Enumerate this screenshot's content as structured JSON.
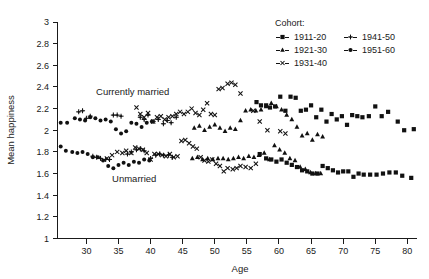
{
  "chart_data": {
    "type": "scatter",
    "title": "",
    "xlabel": "Age",
    "ylabel": "Mean happiness",
    "xlim": [
      25.5,
      81.5
    ],
    "ylim": [
      1,
      3
    ],
    "xticks": [
      30,
      35,
      40,
      45,
      50,
      55,
      60,
      65,
      70,
      75,
      80
    ],
    "yticks": [
      1,
      1.2,
      1.4,
      1.6,
      1.8,
      2,
      2.2,
      2.4,
      2.6,
      2.8,
      3
    ],
    "grid": false,
    "legend_position": "top-right",
    "legend_title": "Cohort:",
    "annotations": [
      {
        "text": "Currently married",
        "x": 31.5,
        "y": 2.33
      },
      {
        "text": "Unmarried",
        "x": 34.0,
        "y": 1.52
      }
    ],
    "groups": [
      {
        "name": "Currently married",
        "description": "upper band of points"
      },
      {
        "name": "Unmarried",
        "description": "lower band of points"
      }
    ],
    "series": [
      {
        "name": "1911-20",
        "marker": "square",
        "group": "Currently married",
        "points": [
          [
            56.5,
            2.26
          ],
          [
            57.2,
            2.23
          ],
          [
            58.0,
            2.23
          ],
          [
            58.6,
            2.21
          ],
          [
            59.4,
            2.22
          ],
          [
            60.2,
            2.31
          ],
          [
            61.0,
            2.18
          ],
          [
            61.8,
            2.31
          ],
          [
            62.6,
            2.3
          ],
          [
            63.4,
            2.18
          ],
          [
            64.2,
            2.19
          ],
          [
            65.0,
            2.23
          ],
          [
            65.8,
            2.12
          ],
          [
            66.6,
            2.19
          ],
          [
            67.4,
            2.08
          ],
          [
            68.2,
            2.15
          ],
          [
            69.0,
            2.1
          ],
          [
            69.8,
            2.13
          ],
          [
            70.6,
            2.05
          ],
          [
            71.4,
            2.14
          ],
          [
            72.2,
            2.13
          ],
          [
            73.0,
            2.12
          ],
          [
            74.0,
            2.13
          ],
          [
            75.0,
            2.22
          ],
          [
            76.0,
            2.13
          ],
          [
            77.0,
            2.17
          ],
          [
            78.5,
            2.08
          ],
          [
            79.5,
            2.0
          ],
          [
            81.0,
            2.01
          ]
        ]
      },
      {
        "name": "1911-20",
        "marker": "square",
        "group": "Unmarried",
        "points": [
          [
            57.0,
            1.78
          ],
          [
            58.0,
            1.74
          ],
          [
            58.8,
            1.73
          ],
          [
            59.6,
            1.71
          ],
          [
            60.4,
            1.73
          ],
          [
            61.2,
            1.7
          ],
          [
            62.0,
            1.68
          ],
          [
            62.8,
            1.66
          ],
          [
            63.6,
            1.63
          ],
          [
            64.4,
            1.62
          ],
          [
            65.2,
            1.6
          ],
          [
            66.0,
            1.6
          ],
          [
            66.8,
            1.67
          ],
          [
            67.6,
            1.65
          ],
          [
            68.4,
            1.63
          ],
          [
            69.2,
            1.61
          ],
          [
            70.0,
            1.62
          ],
          [
            70.8,
            1.62
          ],
          [
            71.6,
            1.57
          ],
          [
            72.4,
            1.6
          ],
          [
            73.2,
            1.59
          ],
          [
            74.2,
            1.59
          ],
          [
            75.2,
            1.59
          ],
          [
            76.2,
            1.6
          ],
          [
            77.2,
            1.61
          ],
          [
            78.2,
            1.61
          ],
          [
            79.2,
            1.58
          ],
          [
            80.6,
            1.56
          ]
        ]
      },
      {
        "name": "1921-30",
        "marker": "triangle",
        "group": "Currently married",
        "points": [
          [
            46.8,
            2.02
          ],
          [
            47.6,
            2.04
          ],
          [
            48.4,
            2.0
          ],
          [
            49.2,
            2.03
          ],
          [
            50.0,
            2.05
          ],
          [
            50.8,
            2.02
          ],
          [
            51.6,
            1.99
          ],
          [
            52.4,
            2.02
          ],
          [
            53.2,
            2.01
          ],
          [
            54.0,
            2.09
          ],
          [
            54.8,
            2.18
          ],
          [
            55.6,
            2.19
          ],
          [
            56.4,
            2.18
          ],
          [
            57.2,
            2.19
          ],
          [
            58.0,
            2.22
          ],
          [
            58.8,
            2.25
          ],
          [
            59.6,
            2.22
          ],
          [
            60.4,
            2.19
          ],
          [
            61.2,
            2.14
          ],
          [
            62.0,
            2.1
          ],
          [
            62.8,
            2.03
          ],
          [
            63.6,
            1.95
          ],
          [
            64.4,
            1.97
          ],
          [
            65.2,
            1.91
          ],
          [
            66.0,
            1.96
          ],
          [
            66.8,
            1.94
          ]
        ]
      },
      {
        "name": "1921-30",
        "marker": "triangle",
        "group": "Unmarried",
        "points": [
          [
            46.5,
            1.74
          ],
          [
            47.3,
            1.75
          ],
          [
            48.1,
            1.73
          ],
          [
            48.9,
            1.74
          ],
          [
            49.7,
            1.73
          ],
          [
            50.5,
            1.74
          ],
          [
            51.3,
            1.74
          ],
          [
            52.1,
            1.73
          ],
          [
            52.9,
            1.74
          ],
          [
            53.7,
            1.75
          ],
          [
            54.5,
            1.74
          ],
          [
            55.3,
            1.76
          ],
          [
            56.1,
            1.75
          ],
          [
            56.9,
            1.77
          ],
          [
            57.7,
            1.79
          ],
          [
            58.5,
            1.73
          ],
          [
            59.3,
            1.86
          ],
          [
            60.1,
            1.82
          ],
          [
            60.9,
            1.79
          ],
          [
            61.7,
            1.74
          ],
          [
            62.5,
            1.72
          ],
          [
            63.3,
            1.66
          ],
          [
            64.1,
            1.64
          ],
          [
            64.9,
            1.61
          ],
          [
            65.7,
            1.6
          ],
          [
            66.5,
            1.6
          ]
        ]
      },
      {
        "name": "1931-40",
        "marker": "x",
        "group": "Currently married",
        "points": [
          [
            37.8,
            2.21
          ],
          [
            38.4,
            2.15
          ],
          [
            39.0,
            2.12
          ],
          [
            39.6,
            2.16
          ],
          [
            40.4,
            2.08
          ],
          [
            41.0,
            2.12
          ],
          [
            41.6,
            2.13
          ],
          [
            42.2,
            2.1
          ],
          [
            42.8,
            2.12
          ],
          [
            43.4,
            2.13
          ],
          [
            44.0,
            2.15
          ],
          [
            44.6,
            2.17
          ],
          [
            45.2,
            2.15
          ],
          [
            45.8,
            2.17
          ],
          [
            46.4,
            2.2
          ],
          [
            47.0,
            2.16
          ],
          [
            47.6,
            2.14
          ],
          [
            48.2,
            2.19
          ],
          [
            48.8,
            2.25
          ],
          [
            49.4,
            2.15
          ],
          [
            50.0,
            2.14
          ],
          [
            50.6,
            2.38
          ],
          [
            51.2,
            2.39
          ],
          [
            52.0,
            2.43
          ],
          [
            52.6,
            2.44
          ],
          [
            53.2,
            2.42
          ],
          [
            54.0,
            2.34
          ],
          [
            56.0,
            2.18
          ],
          [
            57.0,
            2.08
          ],
          [
            58.2,
            2.0
          ],
          [
            60.2,
            1.99
          ],
          [
            61.0,
            1.97
          ]
        ]
      },
      {
        "name": "1931-40",
        "marker": "x",
        "group": "Unmarried",
        "points": [
          [
            33.2,
            1.74
          ],
          [
            34.0,
            1.77
          ],
          [
            34.8,
            1.8
          ],
          [
            35.6,
            1.79
          ],
          [
            36.2,
            1.81
          ],
          [
            37.0,
            1.79
          ],
          [
            37.6,
            1.84
          ],
          [
            38.2,
            1.83
          ],
          [
            38.8,
            1.82
          ],
          [
            39.4,
            1.79
          ],
          [
            40.0,
            1.73
          ],
          [
            40.6,
            1.78
          ],
          [
            41.2,
            1.78
          ],
          [
            41.8,
            1.77
          ],
          [
            42.4,
            1.76
          ],
          [
            43.0,
            1.78
          ],
          [
            43.6,
            1.75
          ],
          [
            44.2,
            1.76
          ],
          [
            44.8,
            1.9
          ],
          [
            45.4,
            1.91
          ],
          [
            46.0,
            1.88
          ],
          [
            46.6,
            1.85
          ],
          [
            47.2,
            1.83
          ],
          [
            47.8,
            1.75
          ],
          [
            48.4,
            1.72
          ],
          [
            49.0,
            1.71
          ],
          [
            49.6,
            1.73
          ],
          [
            50.2,
            1.69
          ],
          [
            50.8,
            1.67
          ],
          [
            51.4,
            1.62
          ],
          [
            52.0,
            1.65
          ],
          [
            52.8,
            1.64
          ],
          [
            53.4,
            1.65
          ],
          [
            54.0,
            1.67
          ],
          [
            54.8,
            1.66
          ],
          [
            55.6,
            1.65
          ],
          [
            56.4,
            1.69
          ]
        ]
      },
      {
        "name": "1941-50",
        "marker": "plus",
        "group": "Currently married",
        "points": [
          [
            28.8,
            2.17
          ],
          [
            29.4,
            2.18
          ],
          [
            30.0,
            2.11
          ],
          [
            30.6,
            2.13
          ],
          [
            34.2,
            2.14
          ],
          [
            34.8,
            2.14
          ],
          [
            35.4,
            2.13
          ],
          [
            38.4,
            2.12
          ],
          [
            39.0,
            2.1
          ],
          [
            39.6,
            2.14
          ],
          [
            40.4,
            2.08
          ],
          [
            41.2,
            2.1
          ],
          [
            42.0,
            2.06
          ],
          [
            42.6,
            2.09
          ],
          [
            43.2,
            2.07
          ],
          [
            44.0,
            2.12
          ]
        ]
      },
      {
        "name": "1941-50",
        "marker": "plus",
        "group": "Unmarried",
        "points": [
          [
            31.0,
            1.76
          ],
          [
            31.6,
            1.75
          ],
          [
            32.2,
            1.74
          ],
          [
            33.0,
            1.73
          ],
          [
            33.6,
            1.73
          ],
          [
            36.4,
            1.78
          ],
          [
            37.0,
            1.8
          ],
          [
            37.8,
            1.82
          ],
          [
            38.4,
            1.83
          ],
          [
            39.0,
            1.81
          ],
          [
            40.0,
            1.74
          ],
          [
            40.8,
            1.77
          ],
          [
            41.4,
            1.78
          ],
          [
            42.0,
            1.77
          ],
          [
            42.8,
            1.77
          ],
          [
            43.4,
            1.75
          ]
        ]
      },
      {
        "name": "1951-60",
        "marker": "circle",
        "group": "Currently married",
        "points": [
          [
            26.0,
            2.07
          ],
          [
            27.0,
            2.07
          ],
          [
            28.2,
            2.11
          ],
          [
            29.0,
            2.1
          ],
          [
            29.8,
            2.09
          ],
          [
            30.6,
            2.12
          ],
          [
            31.4,
            2.11
          ],
          [
            32.2,
            2.09
          ],
          [
            33.0,
            2.1
          ],
          [
            33.8,
            2.08
          ],
          [
            34.6,
            2.01
          ],
          [
            35.4,
            1.97
          ],
          [
            36.2,
            1.99
          ],
          [
            37.0,
            2.07
          ],
          [
            37.8,
            2.06
          ],
          [
            38.6,
            2.03
          ],
          [
            39.4,
            2.07
          ],
          [
            40.2,
            2.08
          ]
        ]
      },
      {
        "name": "1951-60",
        "marker": "circle",
        "group": "Unmarried",
        "points": [
          [
            26.0,
            1.85
          ],
          [
            26.8,
            1.81
          ],
          [
            27.8,
            1.8
          ],
          [
            28.6,
            1.79
          ],
          [
            29.4,
            1.8
          ],
          [
            30.2,
            1.78
          ],
          [
            31.0,
            1.75
          ],
          [
            31.8,
            1.75
          ],
          [
            32.6,
            1.72
          ],
          [
            33.4,
            1.67
          ],
          [
            34.2,
            1.65
          ],
          [
            35.0,
            1.68
          ],
          [
            35.8,
            1.7
          ],
          [
            36.6,
            1.68
          ],
          [
            37.4,
            1.71
          ],
          [
            38.2,
            1.7
          ],
          [
            39.0,
            1.73
          ],
          [
            39.8,
            1.72
          ]
        ]
      }
    ]
  },
  "legend": {
    "title": "Cohort:",
    "entries": [
      {
        "label": "1911-20",
        "marker": "square",
        "col": 0,
        "row": 0
      },
      {
        "label": "1921-30",
        "marker": "triangle",
        "col": 0,
        "row": 1
      },
      {
        "label": "1931-40",
        "marker": "x",
        "col": 0,
        "row": 2
      },
      {
        "label": "1941-50",
        "marker": "plus",
        "col": 1,
        "row": 0
      },
      {
        "label": "1951-60",
        "marker": "circle",
        "col": 1,
        "row": 1
      }
    ]
  },
  "colors": {
    "marker": "#111111",
    "axis": "#1a1a1a",
    "background": "#ffffff"
  }
}
